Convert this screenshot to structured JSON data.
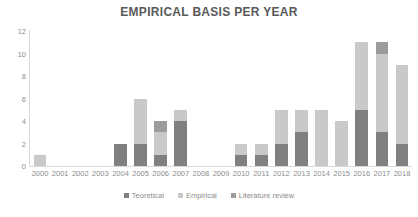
{
  "chart_data": {
    "type": "bar",
    "title": "EMPIRICAL BASIS PER YEAR",
    "xlabel": "",
    "ylabel": "",
    "ylim": [
      0,
      12
    ],
    "yticks": [
      0,
      2,
      4,
      6,
      8,
      10,
      12
    ],
    "grid": false,
    "stacked": true,
    "legend_position": "bottom",
    "categories": [
      "2000",
      "2001",
      "2002",
      "2003",
      "2004",
      "2005",
      "2006",
      "2007",
      "2008",
      "2009",
      "2010",
      "2011",
      "2012",
      "2013",
      "2014",
      "2015",
      "2016",
      "2017",
      "2018"
    ],
    "series": [
      {
        "name": "Teoretical",
        "color": "#808080",
        "values": [
          0,
          0,
          0,
          0,
          2,
          2,
          1,
          4,
          0,
          0,
          1,
          1,
          2,
          3,
          0,
          0,
          5,
          3,
          2
        ]
      },
      {
        "name": "Empirical",
        "color": "#c9c9c9",
        "values": [
          1,
          0,
          0,
          0,
          0,
          4,
          2,
          1,
          0,
          0,
          1,
          1,
          3,
          2,
          5,
          4,
          6,
          7,
          7
        ]
      },
      {
        "name": "Literature review",
        "color": "#9c9c9c",
        "values": [
          0,
          0,
          0,
          0,
          0,
          0,
          1,
          0,
          0,
          0,
          0,
          0,
          0,
          0,
          0,
          0,
          0,
          1,
          0
        ]
      }
    ],
    "totals": [
      1,
      0,
      0,
      0,
      2,
      6,
      4,
      5,
      0,
      0,
      2,
      2,
      5,
      5,
      5,
      4,
      11,
      11,
      9
    ]
  },
  "legend": {
    "items": [
      {
        "label": "Teoretical"
      },
      {
        "label": "Empirical"
      },
      {
        "label": "Literature review"
      }
    ]
  },
  "colors": {
    "axis": "#d9d9d9",
    "tick_text": "#8c8c8c",
    "title_text": "#595959",
    "background": "#ffffff"
  }
}
